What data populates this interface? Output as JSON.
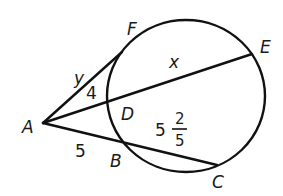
{
  "diagram": {
    "type": "circle-secant-tangent",
    "stroke_color": "#111111",
    "points": {
      "A": {
        "label": "A",
        "x": 43,
        "y": 123
      },
      "F": {
        "label": "F",
        "x": 122,
        "y": 52
      },
      "D": {
        "label": "D",
        "x": 108,
        "y": 101
      },
      "E": {
        "label": "E",
        "x": 252,
        "y": 54
      },
      "B": {
        "label": "B",
        "x": 123,
        "y": 142
      },
      "C": {
        "label": "C",
        "x": 217,
        "y": 165
      }
    },
    "circle": {
      "cx": 186,
      "cy": 96,
      "rx": 79,
      "ry": 76
    },
    "segments": [
      {
        "name": "AF",
        "from": "A",
        "to": "F",
        "kind": "tangent"
      },
      {
        "name": "AE",
        "from": "A",
        "to": "E",
        "kind": "secant"
      },
      {
        "name": "AC",
        "from": "A",
        "to": "C",
        "kind": "secant"
      }
    ],
    "measure_labels": {
      "AF": "y",
      "AD": "4",
      "DE": "x",
      "AB": "5",
      "BC_whole": "5",
      "BC_num": "2",
      "BC_den": "5"
    }
  }
}
